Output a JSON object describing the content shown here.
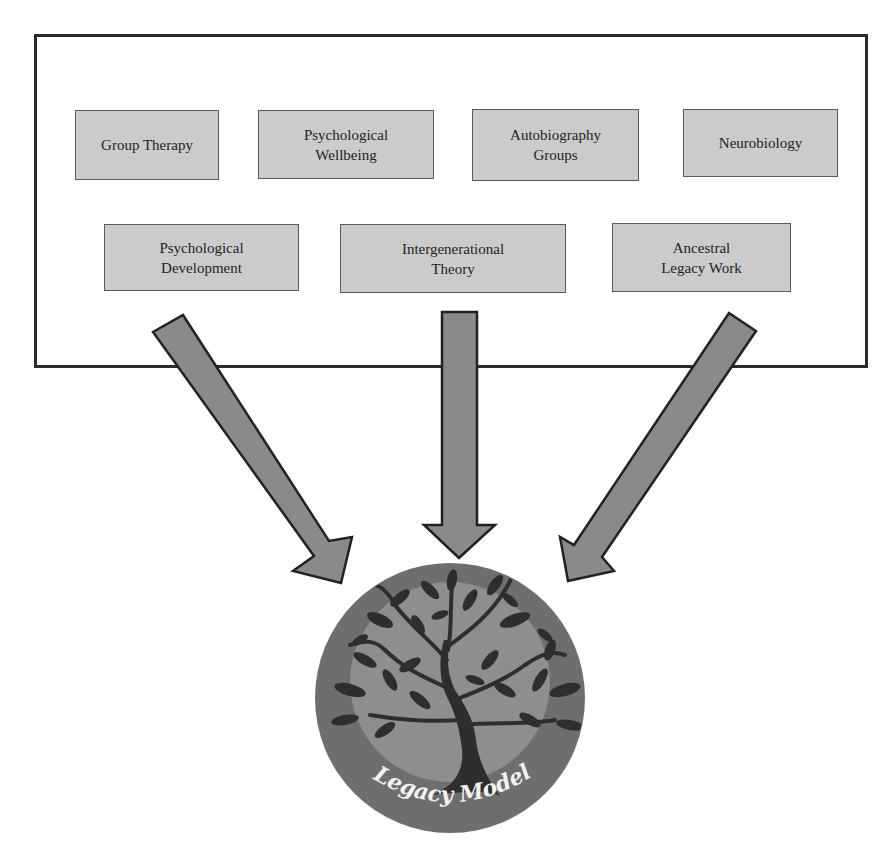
{
  "diagram": {
    "title_label": "Legacy Model",
    "inputs_row1": [
      {
        "id": "group-therapy",
        "label": "Group Therapy"
      },
      {
        "id": "psychological-wellbeing",
        "label": "Psychological\nWellbeing"
      },
      {
        "id": "autobiography-groups",
        "label": "Autobiography\nGroups"
      },
      {
        "id": "neurobiology",
        "label": "Neurobiology"
      }
    ],
    "inputs_row2": [
      {
        "id": "psychological-development",
        "label": "Psychological\nDevelopment"
      },
      {
        "id": "intergenerational-theory",
        "label": "Intergenerational\nTheory"
      },
      {
        "id": "ancestral-legacy-work",
        "label": "Ancestral\nLegacy Work"
      }
    ],
    "arrows": [
      "left-diagonal",
      "center-vertical",
      "right-diagonal"
    ],
    "emblem": {
      "label": "Legacy Model",
      "icon": "tree-icon"
    },
    "colors": {
      "box_fill": "#cbcbcb",
      "box_border": "#5a5a5a",
      "arrow_fill": "#8a8a8a",
      "arrow_border": "#222222",
      "emblem_outer": "#6e6e6e",
      "emblem_inner": "#8e8e8e",
      "tree": "#2e2e2e",
      "label_text": "#f2f2f2"
    }
  }
}
